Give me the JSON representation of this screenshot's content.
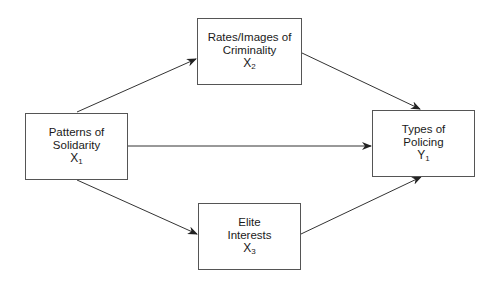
{
  "nodes": {
    "x1": {
      "line1": "Patterns of",
      "line2": "Solidarity",
      "var": "X",
      "sub": "1"
    },
    "x2": {
      "line1": "Rates/Images of",
      "line2": "Criminality",
      "var": "X",
      "sub": "2"
    },
    "x3": {
      "line1": "Elite",
      "line2": "Interests",
      "var": "X",
      "sub": "3"
    },
    "y1": {
      "line1": "Types of",
      "line2": "Policing",
      "var": "Y",
      "sub": "1"
    }
  },
  "edges": [
    {
      "from": "x1",
      "to": "x2"
    },
    {
      "from": "x1",
      "to": "y1"
    },
    {
      "from": "x1",
      "to": "x3"
    },
    {
      "from": "x2",
      "to": "y1"
    },
    {
      "from": "x3",
      "to": "y1"
    }
  ],
  "colors": {
    "line": "#333333",
    "border": "#555555"
  }
}
